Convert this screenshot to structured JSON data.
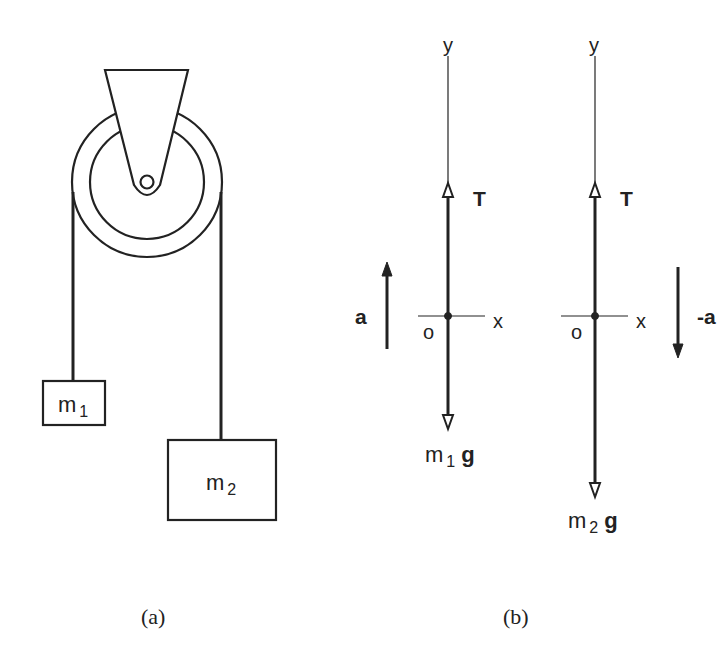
{
  "figure": {
    "panel_a": {
      "caption": "(a)",
      "mass1_label": "m",
      "mass1_sub": "1",
      "mass2_label": "m",
      "mass2_sub": "2"
    },
    "panel_b": {
      "caption": "(b)",
      "body1": {
        "y_axis": "y",
        "x_axis": "x",
        "origin": "o",
        "tension": "T",
        "weight_m": "m",
        "weight_sub": "1",
        "weight_g": "g",
        "accel": "a"
      },
      "body2": {
        "y_axis": "y",
        "x_axis": "x",
        "origin": "o",
        "tension": "T",
        "weight_m": "m",
        "weight_sub": "2",
        "weight_g": "g",
        "accel": "-a"
      }
    },
    "colors": {
      "ink": "#222222",
      "background": "#ffffff"
    }
  }
}
